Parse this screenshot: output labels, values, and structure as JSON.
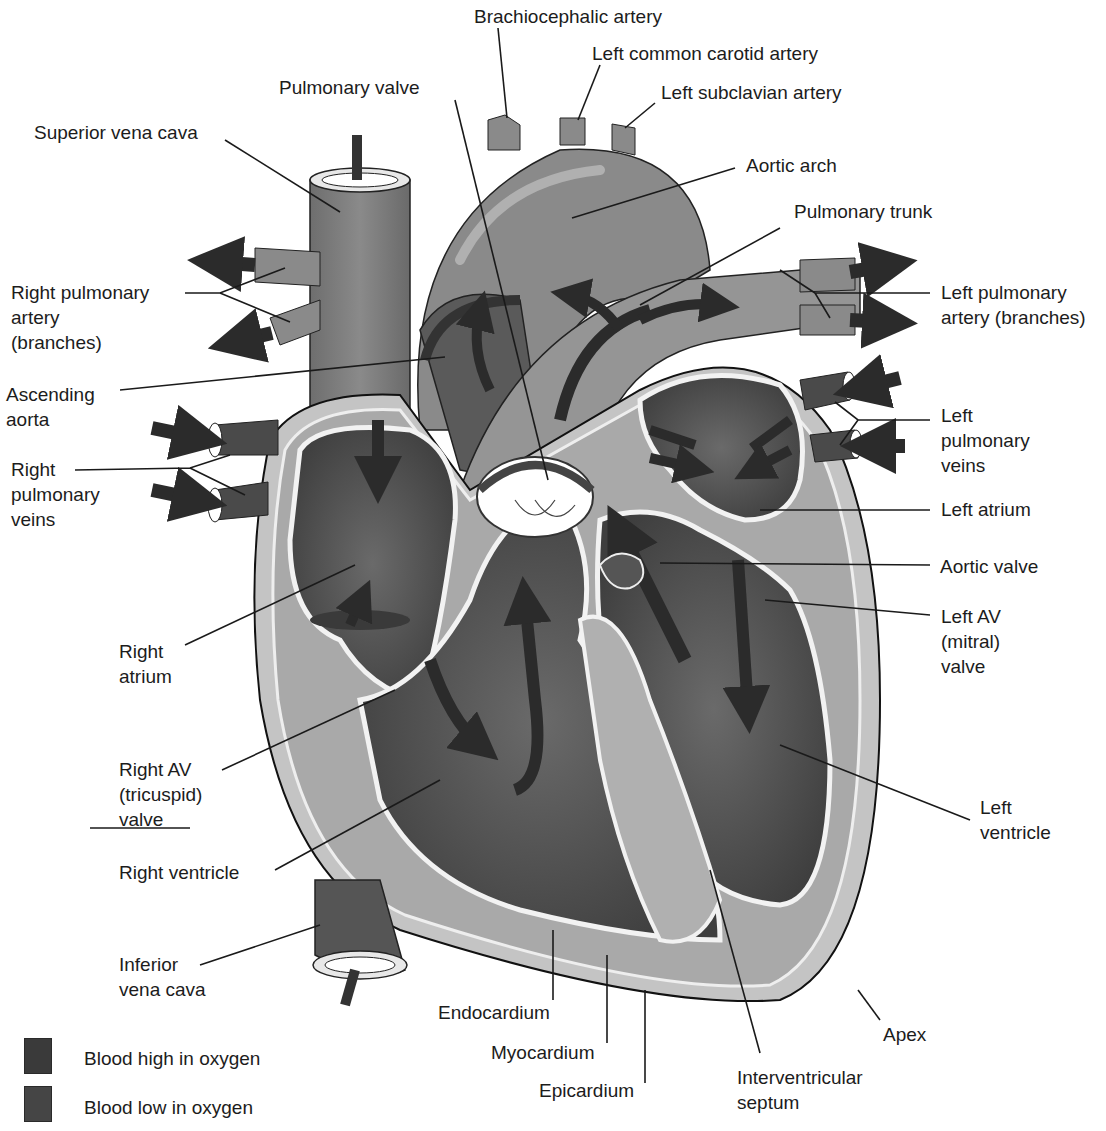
{
  "colors": {
    "background": "#ffffff",
    "high_oxygen": "#3a3a3a",
    "low_oxygen": "#454545",
    "vessel_gray": "#7a7a7a",
    "chamber_dark": "#555555",
    "myocardium_light": "#b5b5b5",
    "endocardium_white": "#f2f2f2",
    "leader_line": "#1a1a1a"
  },
  "labels": {
    "brachiocephalic_artery": "Brachiocephalic artery",
    "left_common_carotid_artery": "Left common carotid artery",
    "left_subclavian_artery": "Left subclavian artery",
    "pulmonary_valve": "Pulmonary valve",
    "superior_vena_cava": "Superior vena cava",
    "aortic_arch": "Aortic arch",
    "pulmonary_trunk": "Pulmonary trunk",
    "right_pulmonary_artery": "Right pulmonary\nartery\n(branches)",
    "left_pulmonary_artery": "Left pulmonary\nartery (branches)",
    "ascending_aorta": "Ascending\naorta",
    "right_pulmonary_veins": "Right\npulmonary\nveins",
    "left_pulmonary_veins": "Left\npulmonary\nveins",
    "left_atrium": "Left atrium",
    "aortic_valve": "Aortic valve",
    "left_av_valve": "Left AV\n(mitral)\nvalve",
    "right_atrium": "Right\natrium",
    "right_av_valve": "Right AV\n(tricuspid)\nvalve",
    "right_ventricle": "Right ventricle",
    "left_ventricle": "Left\nventricle",
    "inferior_vena_cava": "Inferior\nvena cava",
    "endocardium": "Endocardium",
    "myocardium": "Myocardium",
    "epicardium": "Epicardium",
    "apex": "Apex",
    "interventricular_septum": "Interventricular\nseptum"
  },
  "legend": {
    "items": [
      {
        "label": "Blood high in oxygen",
        "color": "#3a3a3a"
      },
      {
        "label": "Blood low in oxygen",
        "color": "#454545"
      }
    ]
  }
}
